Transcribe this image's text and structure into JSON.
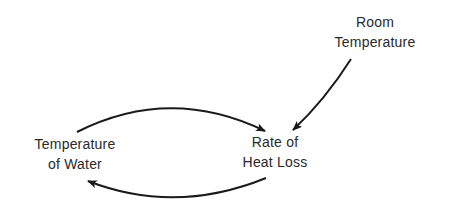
{
  "diagram": {
    "type": "causal-loop",
    "nodes": [
      {
        "id": "room_temperature",
        "lines": [
          "Room",
          "Temperature"
        ]
      },
      {
        "id": "temperature_of_water",
        "lines": [
          "Temperature",
          "of Water"
        ]
      },
      {
        "id": "rate_of_heat_loss",
        "lines": [
          "Rate of",
          "Heat Loss"
        ]
      }
    ],
    "edges": [
      {
        "from": "room_temperature",
        "to": "rate_of_heat_loss",
        "shape": "slightly curved"
      },
      {
        "from": "temperature_of_water",
        "to": "rate_of_heat_loss",
        "shape": "upper arc"
      },
      {
        "from": "rate_of_heat_loss",
        "to": "temperature_of_water",
        "shape": "lower arc"
      }
    ],
    "colors": {
      "ink": "#1a1a1a",
      "text": "#2a2a2a",
      "background": "#ffffff"
    }
  }
}
